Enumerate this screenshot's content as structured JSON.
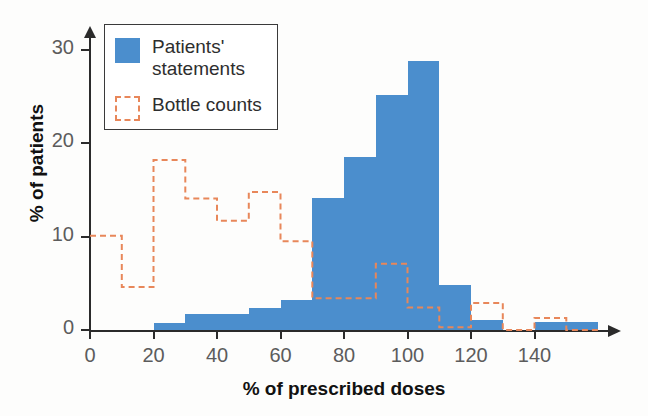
{
  "chart_data": {
    "type": "bar",
    "title": "",
    "xlabel": "% of prescribed doses",
    "ylabel": "% of patients",
    "xlim": [
      0,
      160
    ],
    "ylim": [
      0,
      30
    ],
    "xticks": [
      0,
      20,
      40,
      60,
      80,
      100,
      120,
      140
    ],
    "yticks": [
      0,
      10,
      20,
      30
    ],
    "grid": false,
    "legend_position": "upper-left",
    "bin_width": 10,
    "bin_starts": [
      0,
      10,
      20,
      30,
      40,
      50,
      60,
      70,
      80,
      90,
      100,
      110,
      120,
      130,
      140,
      150
    ],
    "categories": [
      "0-10",
      "10-20",
      "20-30",
      "30-40",
      "40-50",
      "50-60",
      "60-70",
      "70-80",
      "80-90",
      "90-100",
      "100-110",
      "110-120",
      "120-130",
      "130-140",
      "140-150",
      "150-160"
    ],
    "series": [
      {
        "name": "Patients' statements",
        "style": "filled-bars",
        "color": "#4b8ecd",
        "values": [
          0,
          0,
          0.8,
          1.7,
          1.7,
          2.4,
          3.2,
          14.1,
          18.5,
          25.2,
          28.8,
          4.8,
          1.1,
          0,
          0.9,
          0.9
        ]
      },
      {
        "name": "Bottle counts",
        "style": "dashed-outline",
        "color": "#e8875a",
        "values": [
          10.1,
          4.6,
          18.2,
          14.1,
          11.7,
          14.8,
          9.5,
          3.4,
          3.4,
          7.1,
          2.4,
          0.3,
          2.9,
          0,
          1.3,
          0
        ]
      }
    ]
  },
  "legend": {
    "items": [
      {
        "label": "Patients'\nstatements",
        "icon": "filled-square-swatch"
      },
      {
        "label": "Bottle counts",
        "icon": "dashed-square-swatch"
      }
    ]
  },
  "axes": {
    "y_tick_labels": [
      "0",
      "10",
      "20",
      "30"
    ],
    "x_tick_labels": [
      "0",
      "20",
      "40",
      "60",
      "80",
      "100",
      "120",
      "140"
    ]
  },
  "colors": {
    "patients_blue": "#4b8ecd",
    "bottle_orange": "#e8875a",
    "axis": "#2b2b2b",
    "tick_text": "#5c5c5c",
    "label_text": "#111111"
  }
}
